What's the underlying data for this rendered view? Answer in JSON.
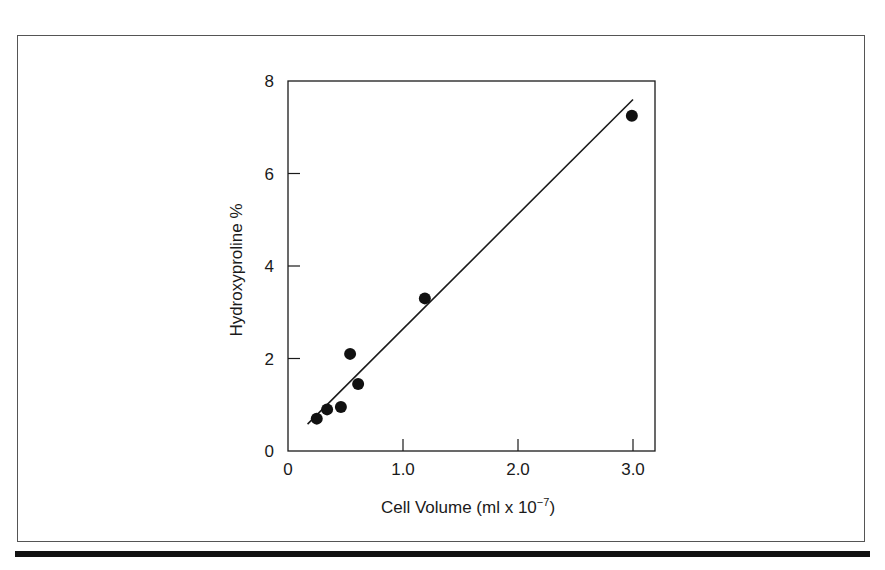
{
  "chart_data": {
    "type": "scatter",
    "title": "",
    "xlabel": "Cell Volume (ml x 10⁻⁷)",
    "xlabel_main": "Cell Volume (ml x 10",
    "xlabel_exp": "−7",
    "xlabel_close": ")",
    "ylabel": "Hydroxyproline %",
    "xlim": [
      0,
      3.2
    ],
    "ylim": [
      0,
      8
    ],
    "x_ticks": [
      0,
      1.0,
      2.0,
      3.0
    ],
    "x_tick_labels": [
      "0",
      "1.0",
      "2.0",
      "3.0"
    ],
    "y_ticks": [
      0,
      2,
      4,
      6,
      8
    ],
    "y_tick_labels": [
      "0",
      "2",
      "4",
      "6",
      "8"
    ],
    "grid": false,
    "legend": null,
    "series": [
      {
        "name": "measurements",
        "marker": "filled-circle",
        "points": [
          {
            "x": 0.25,
            "y": 0.7
          },
          {
            "x": 0.34,
            "y": 0.9
          },
          {
            "x": 0.46,
            "y": 0.95
          },
          {
            "x": 0.54,
            "y": 2.1
          },
          {
            "x": 0.61,
            "y": 1.45
          },
          {
            "x": 1.19,
            "y": 3.3
          },
          {
            "x": 2.99,
            "y": 7.25
          }
        ]
      }
    ],
    "fit_line": {
      "x0": 0.17,
      "y0": 0.58,
      "x1": 3.0,
      "y1": 7.6
    },
    "colors": {
      "ink": "#1a1a1a",
      "frame": "#555555",
      "rule": "#111111"
    }
  }
}
